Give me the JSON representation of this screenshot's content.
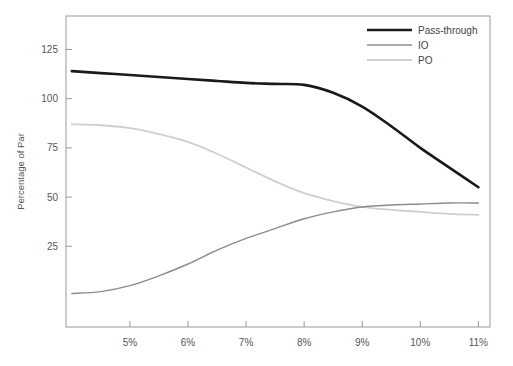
{
  "chart_data": {
    "type": "line",
    "title": "",
    "xlabel": "",
    "ylabel": "Percentage of Par",
    "xlim": [
      3.9,
      11.2
    ],
    "ylim": [
      -16,
      142
    ],
    "grid": false,
    "legend_position": "top-right",
    "xtick_labels": [
      "5%",
      "6%",
      "7%",
      "8%",
      "9%",
      "10%",
      "11%"
    ],
    "xtick_values": [
      5,
      6,
      7,
      8,
      9,
      10,
      11
    ],
    "ytick_labels": [
      "125",
      "100",
      "75",
      "50",
      "25"
    ],
    "ytick_values": [
      125,
      100,
      75,
      50,
      25
    ],
    "x": [
      4.0,
      4.5,
      5.0,
      5.5,
      6.0,
      6.5,
      7.0,
      7.5,
      8.0,
      8.5,
      9.0,
      9.5,
      10.0,
      10.5,
      11.0
    ],
    "series": [
      {
        "name": "Pass-through",
        "color": "#1a1a1a",
        "width": 2.6,
        "values": [
          114,
          113,
          112,
          111,
          110,
          109,
          108,
          107.5,
          107,
          103,
          96,
          86,
          75,
          65,
          55
        ]
      },
      {
        "name": "IO",
        "color": "#8c8c8c",
        "width": 1.4,
        "values": [
          1,
          2,
          5,
          10,
          16,
          23,
          29,
          34,
          39,
          42.5,
          45,
          46,
          46.5,
          47,
          47
        ]
      },
      {
        "name": "PO",
        "color": "#cfcfcf",
        "width": 1.8,
        "values": [
          87,
          86.5,
          85,
          82,
          78,
          72,
          65,
          58,
          52,
          48,
          45,
          43.5,
          42.5,
          41.5,
          41
        ]
      }
    ]
  },
  "legend": {
    "entries": [
      {
        "label": "Pass-through"
      },
      {
        "label": "IO"
      },
      {
        "label": "PO"
      }
    ]
  },
  "axes": {
    "y_title": "Percentage of Par"
  }
}
